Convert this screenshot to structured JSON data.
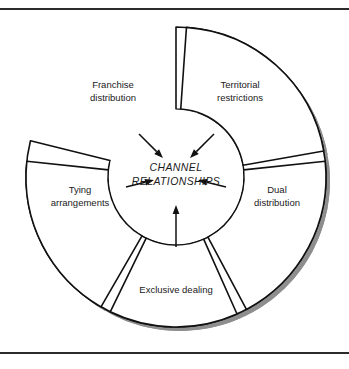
{
  "figure": {
    "name": "channel-relationships-wheel",
    "hub": {
      "line1": "CHANNEL",
      "line2": "RELATIONSHIPS"
    },
    "segments": [
      {
        "id": "franchise-distribution",
        "line1": "Franchise",
        "line2": "distribution",
        "label_x": 113,
        "label_y": 88,
        "start_angle": -90,
        "end_angle": -166,
        "arrow": {
          "x1": 139,
          "y1": 134,
          "x2": 163,
          "y2": 158
        }
      },
      {
        "id": "territorial-restrictions",
        "line1": "Territorial",
        "line2": "restrictions",
        "label_x": 240,
        "label_y": 88,
        "start_angle": -86,
        "end_angle": -10,
        "arrow": {
          "x1": 214,
          "y1": 134,
          "x2": 190,
          "y2": 158
        }
      },
      {
        "id": "dual-distribution",
        "line1": "Dual",
        "line2": "distribution",
        "label_x": 277,
        "label_y": 193,
        "start_angle": -6,
        "end_angle": 62,
        "arrow": {
          "x1": 226,
          "y1": 187,
          "x2": 198,
          "y2": 180
        }
      },
      {
        "id": "exclusive-dealing",
        "line1": "Exclusive dealing",
        "line2": "",
        "label_x": 176,
        "label_y": 293,
        "start_angle": 66,
        "end_angle": 116,
        "arrow": {
          "x1": 176,
          "y1": 247,
          "x2": 176,
          "y2": 205
        }
      },
      {
        "id": "tying-arrangements",
        "line1": "Tying",
        "line2": "arrangements",
        "label_x": 80,
        "label_y": 193,
        "start_angle": 120,
        "end_angle": 186,
        "arrow": {
          "x1": 126,
          "y1": 187,
          "x2": 154,
          "y2": 180
        }
      }
    ],
    "geometry": {
      "center_x": 176,
      "center_y": 177,
      "outer_radius": 150,
      "inner_radius": 68,
      "shadow_offset_x": 4,
      "shadow_offset_y": 4
    },
    "colors": {
      "outline": "#111111",
      "shadow": "#8e8e8e",
      "fill": "#ffffff",
      "text": "#1a1a1a",
      "rule": "#2b2b2b"
    }
  }
}
